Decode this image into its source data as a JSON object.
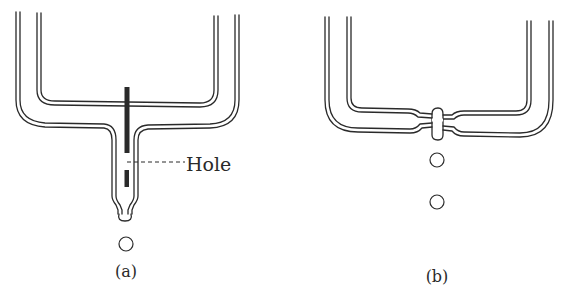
{
  "figure": {
    "panel_a": {
      "caption": "(a)",
      "annotation": "Hole",
      "parts": [
        "double-walled tube network",
        "central rod",
        "hole",
        "nozzle tip",
        "droplet"
      ]
    },
    "panel_b": {
      "caption": "(b)",
      "parts": [
        "double-walled tube network",
        "junction bulge",
        "droplet 1",
        "droplet 2"
      ]
    },
    "colors": {
      "line": "#2a2a2a",
      "rod": "#2a2a2a",
      "background": "#ffffff"
    }
  }
}
